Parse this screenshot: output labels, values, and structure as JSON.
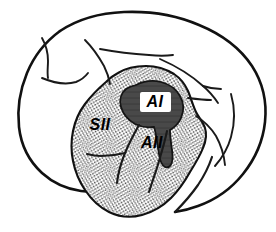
{
  "figure": {
    "orientation": "lateral",
    "background_color": "#ffffff",
    "ink_color": "#111111"
  },
  "regions": [
    {
      "id": "AI",
      "label": "AI",
      "description": "Primary auditory field, dark shaded",
      "fill_color": "#4a4a4a",
      "texture": "solid-dark",
      "label_x": 155,
      "label_y": 102
    },
    {
      "id": "AII",
      "label": "AII",
      "description": "Second auditory field, stippled",
      "fill_color": "#d8d8d8",
      "texture": "stipple",
      "label_x": 152,
      "label_y": 144
    },
    {
      "id": "SII",
      "label": "SII",
      "description": "Second somatosensory field, stippled",
      "fill_color": "#d8d8d8",
      "texture": "stipple",
      "label_x": 100,
      "label_y": 126
    }
  ],
  "colors": {
    "stipple_dot": "#000000",
    "stipple_base": "#ffffff",
    "dark_region": "#4a4a4a",
    "outline": "#111111",
    "label_text": "#000000",
    "label_plate": "#ffffff"
  }
}
